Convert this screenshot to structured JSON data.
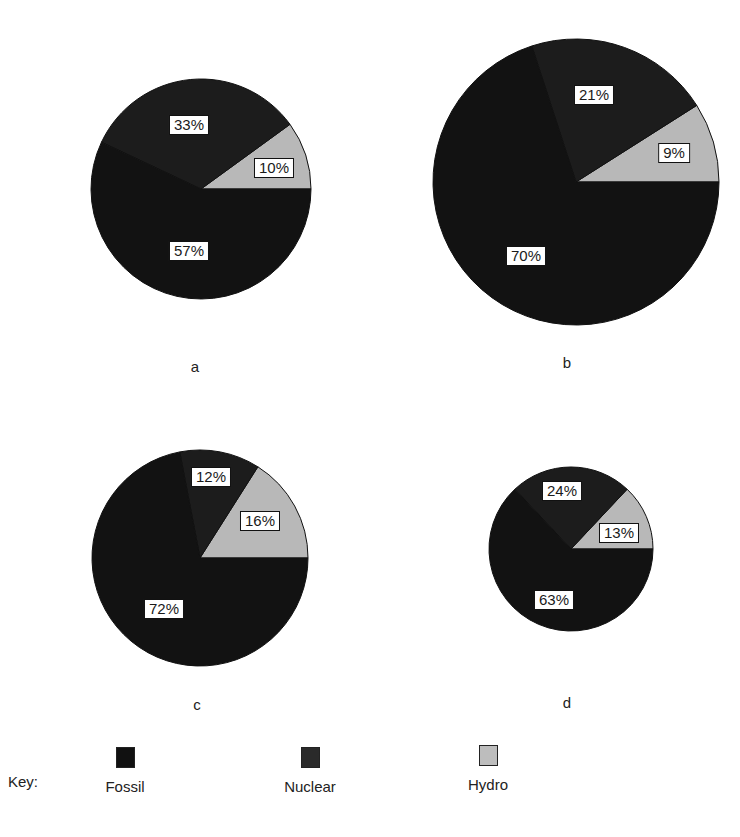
{
  "chart_data": [
    {
      "type": "pie",
      "title": "a",
      "categories": [
        "Fossil",
        "Nuclear",
        "Hydro"
      ],
      "values": [
        57,
        33,
        10
      ],
      "labels": [
        "57%",
        "33%",
        "10%"
      ],
      "center": [
        201,
        189
      ],
      "radius": 110,
      "label_positions": [
        [
          189,
          251
        ],
        [
          189,
          125
        ],
        [
          274,
          168
        ]
      ]
    },
    {
      "type": "pie",
      "title": "b",
      "categories": [
        "Fossil",
        "Nuclear",
        "Hydro"
      ],
      "values": [
        70,
        21,
        9
      ],
      "labels": [
        "70%",
        "21%",
        "9%"
      ],
      "center": [
        576,
        182
      ],
      "radius": 143,
      "label_positions": [
        [
          526,
          256
        ],
        [
          594,
          95
        ],
        [
          674,
          153
        ]
      ]
    },
    {
      "type": "pie",
      "title": "c",
      "categories": [
        "Fossil",
        "Nuclear",
        "Hydro"
      ],
      "values": [
        72,
        12,
        16
      ],
      "labels": [
        "72%",
        "12%",
        "16%"
      ],
      "center": [
        200,
        558
      ],
      "radius": 108,
      "label_positions": [
        [
          164,
          609
        ],
        [
          211,
          477
        ],
        [
          260,
          521
        ]
      ]
    },
    {
      "type": "pie",
      "title": "d",
      "categories": [
        "Fossil",
        "Nuclear",
        "Hydro"
      ],
      "values": [
        63,
        24,
        13
      ],
      "labels": [
        "63%",
        "24%",
        "13%"
      ],
      "center": [
        571,
        549
      ],
      "radius": 82,
      "label_positions": [
        [
          554,
          600
        ],
        [
          562,
          491
        ],
        [
          619,
          533
        ]
      ]
    }
  ],
  "charts": {
    "a": {
      "letter": "a",
      "letter_pos": [
        195,
        366
      ]
    },
    "b": {
      "letter": "b",
      "letter_pos": [
        567,
        362
      ]
    },
    "c": {
      "letter": "c",
      "letter_pos": [
        197,
        704
      ]
    },
    "d": {
      "letter": "d",
      "letter_pos": [
        567,
        702
      ]
    }
  },
  "key": {
    "title": "Key:",
    "items": [
      {
        "label": "Fossil",
        "color": "#111111",
        "x": 125
      },
      {
        "label": "Nuclear",
        "color": "#2a2a2a",
        "x": 310
      },
      {
        "label": "Hydro",
        "color": "#bdbdbd",
        "x": 488
      }
    ]
  },
  "colors": {
    "Fossil": "#121212",
    "Nuclear": "#1c1c1c",
    "Hydro": "#b8b8b8"
  }
}
